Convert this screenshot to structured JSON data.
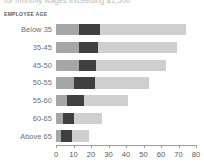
{
  "headline": {
    "text": "for monthly wages exceeding $1,500"
  },
  "category_axis": {
    "title": "EMPLOYEE AGE"
  },
  "colors": {
    "series_1": "#a6a6a6",
    "series_2": "#3f3f3f",
    "series_3": "#cfcfcf",
    "axis": "#9a9da1",
    "label_text": "#6a6e72",
    "background": "#ffffff"
  },
  "chart_data": {
    "type": "bar",
    "orientation": "horizontal",
    "stacked": true,
    "title": "",
    "subtitle": "",
    "xlabel": "",
    "ylabel": "EMPLOYEE AGE",
    "xlim": [
      0,
      80
    ],
    "grid": false,
    "legend": null,
    "xticks": [
      0,
      10,
      20,
      30,
      40,
      50,
      60,
      70,
      80
    ],
    "xtick_labels": [
      "0",
      "10",
      "20",
      "30",
      "40",
      "50",
      "60",
      "70",
      "80"
    ],
    "categories": [
      "Below 35",
      "35-45",
      "45-50",
      "50-55",
      "55-60",
      "60-65",
      "Above 65"
    ],
    "series": [
      {
        "name": "series-1",
        "color": "#a6a6a6",
        "values": [
          13,
          13,
          13,
          10,
          6,
          4,
          3
        ]
      },
      {
        "name": "series-2",
        "color": "#3f3f3f",
        "values": [
          12,
          11,
          10,
          12,
          10,
          6,
          6
        ]
      },
      {
        "name": "series-3",
        "color": "#cfcfcf",
        "values": [
          49,
          45,
          40,
          31,
          25,
          16,
          10
        ]
      }
    ],
    "totals": [
      74,
      69,
      63,
      53,
      41,
      26,
      19
    ]
  }
}
